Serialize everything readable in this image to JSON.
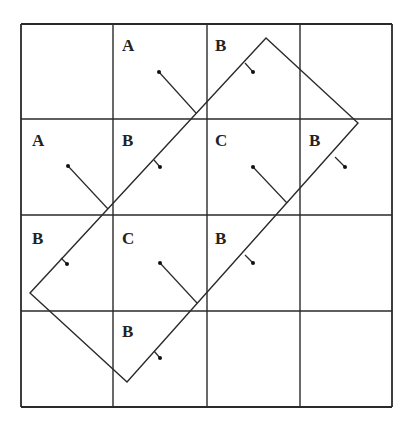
{
  "diagram": {
    "colors": {
      "background": "#ffffff",
      "stroke": "#2a2a2a",
      "label": "#222222"
    },
    "grid": {
      "rows": 4,
      "cols": 4,
      "x_lines": [
        21,
        113,
        207,
        300,
        392
      ],
      "y_lines": [
        24,
        119,
        215,
        311,
        407
      ]
    },
    "rectangle": {
      "corners": [
        [
          266,
          38
        ],
        [
          358,
          123
        ],
        [
          127,
          382
        ],
        [
          30,
          293
        ]
      ]
    },
    "cells": [
      {
        "row": 0,
        "col": 1,
        "label": "A",
        "label_pos": [
          122,
          51
        ],
        "point": [
          159,
          72
        ],
        "edge": [
          196,
          113
        ],
        "kind": "outside"
      },
      {
        "row": 0,
        "col": 2,
        "label": "B",
        "label_pos": [
          215,
          51
        ],
        "point": [
          253,
          72
        ],
        "edge": [
          245,
          63
        ],
        "kind": "inside"
      },
      {
        "row": 1,
        "col": 0,
        "label": "A",
        "label_pos": [
          32,
          146
        ],
        "point": [
          68,
          166
        ],
        "edge": [
          108,
          209
        ],
        "kind": "outside"
      },
      {
        "row": 1,
        "col": 1,
        "label": "B",
        "label_pos": [
          122,
          146
        ],
        "point": [
          160,
          167
        ],
        "edge": [
          154,
          160
        ],
        "kind": "inside"
      },
      {
        "row": 1,
        "col": 2,
        "label": "C",
        "label_pos": [
          215,
          146
        ],
        "point": [
          253,
          167
        ],
        "edge": [
          287,
          203
        ],
        "kind": "outside"
      },
      {
        "row": 1,
        "col": 3,
        "label": "B",
        "label_pos": [
          309,
          146
        ],
        "point": [
          345,
          167
        ],
        "edge": [
          335,
          157
        ],
        "kind": "inside"
      },
      {
        "row": 2,
        "col": 0,
        "label": "B",
        "label_pos": [
          32,
          244
        ],
        "point": [
          67,
          264
        ],
        "edge": [
          61,
          258
        ],
        "kind": "inside"
      },
      {
        "row": 2,
        "col": 1,
        "label": "C",
        "label_pos": [
          122,
          244
        ],
        "point": [
          160,
          263
        ],
        "edge": [
          197,
          303
        ],
        "kind": "outside"
      },
      {
        "row": 2,
        "col": 2,
        "label": "B",
        "label_pos": [
          215,
          244
        ],
        "point": [
          253,
          263
        ],
        "edge": [
          245,
          255
        ],
        "kind": "inside"
      },
      {
        "row": 3,
        "col": 1,
        "label": "B",
        "label_pos": [
          122,
          337
        ],
        "point": [
          160,
          358
        ],
        "edge": [
          154,
          351
        ],
        "kind": "inside"
      }
    ]
  }
}
